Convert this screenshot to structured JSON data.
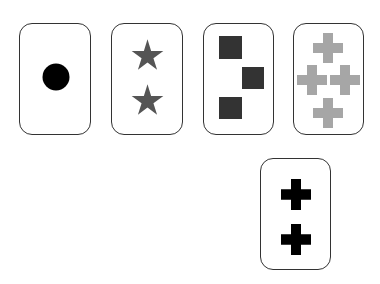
{
  "cards": [
    {
      "id": "card-1",
      "shape": "circle",
      "count": 1,
      "color": "#000000"
    },
    {
      "id": "card-2",
      "shape": "star",
      "count": 2,
      "color": "#555555"
    },
    {
      "id": "card-3",
      "shape": "square",
      "count": 3,
      "color": "#333333"
    },
    {
      "id": "card-4",
      "shape": "cross",
      "count": 4,
      "color": "#a6a6a6"
    },
    {
      "id": "card-5",
      "shape": "cross",
      "count": 2,
      "color": "#000000"
    }
  ]
}
